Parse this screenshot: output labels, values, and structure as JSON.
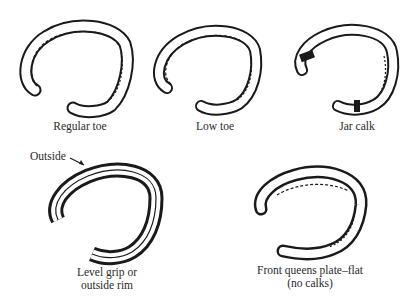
{
  "figure": {
    "type": "diagram",
    "items": [
      {
        "id": "regular-toe",
        "label_lines": [
          "Regular toe"
        ]
      },
      {
        "id": "low-toe",
        "label_lines": [
          "Low toe"
        ]
      },
      {
        "id": "jar-calk",
        "label_lines": [
          "Jar calk"
        ]
      },
      {
        "id": "level-grip",
        "label_lines": [
          "Level grip or",
          "outside rim"
        ],
        "callout": "Outside"
      },
      {
        "id": "front-queens-plate",
        "label_lines": [
          "Front queens plate–flat",
          "(no calks)"
        ]
      }
    ]
  }
}
